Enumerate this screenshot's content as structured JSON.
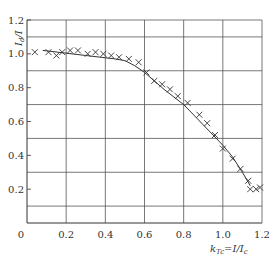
{
  "chart_data": {
    "type": "scatter",
    "title": "",
    "xlabel": "k_Tc = I/I_c",
    "ylabel": "I_d / I",
    "xlim": [
      0,
      1.2
    ],
    "ylim": [
      0,
      1.2
    ],
    "grid": true,
    "x_ticks": [
      "0",
      "0.2",
      "0.4",
      "0.6",
      "0.8",
      "1.0",
      "1.2"
    ],
    "y_ticks": [
      "0.2",
      "0.4",
      "0.6",
      "0.8",
      "1.0",
      "1.2"
    ],
    "series": [
      {
        "name": "measured",
        "marker": "x",
        "points": [
          [
            0.04,
            1.01
          ],
          [
            0.11,
            1.01
          ],
          [
            0.15,
            0.99
          ],
          [
            0.18,
            1.01
          ],
          [
            0.22,
            1.02
          ],
          [
            0.26,
            1.02
          ],
          [
            0.31,
            1.0
          ],
          [
            0.35,
            1.01
          ],
          [
            0.39,
            1.0
          ],
          [
            0.43,
            0.99
          ],
          [
            0.47,
            0.98
          ],
          [
            0.52,
            0.97
          ],
          [
            0.57,
            0.95
          ],
          [
            0.61,
            0.89
          ],
          [
            0.65,
            0.84
          ],
          [
            0.69,
            0.82
          ],
          [
            0.73,
            0.79
          ],
          [
            0.77,
            0.75
          ],
          [
            0.82,
            0.71
          ],
          [
            0.88,
            0.64
          ],
          [
            0.92,
            0.59
          ],
          [
            0.96,
            0.52
          ],
          [
            1.0,
            0.44
          ],
          [
            1.05,
            0.38
          ],
          [
            1.09,
            0.32
          ],
          [
            1.13,
            0.25
          ],
          [
            1.14,
            0.2
          ],
          [
            1.17,
            0.2
          ],
          [
            1.19,
            0.21
          ]
        ]
      },
      {
        "name": "fit",
        "style": "solid",
        "points": [
          [
            0.08,
            1.02
          ],
          [
            0.3,
            0.99
          ],
          [
            0.45,
            0.97
          ],
          [
            0.5,
            0.96
          ],
          [
            0.55,
            0.93
          ],
          [
            0.6,
            0.89
          ],
          [
            0.7,
            0.79
          ],
          [
            0.8,
            0.7
          ],
          [
            0.9,
            0.58
          ],
          [
            1.0,
            0.46
          ],
          [
            1.05,
            0.39
          ],
          [
            1.1,
            0.3
          ],
          [
            1.14,
            0.22
          ]
        ]
      }
    ]
  },
  "labels": {
    "ylabel": "I_d / I",
    "xlabel": "k_Tc = I/I_c",
    "origin": "0"
  }
}
